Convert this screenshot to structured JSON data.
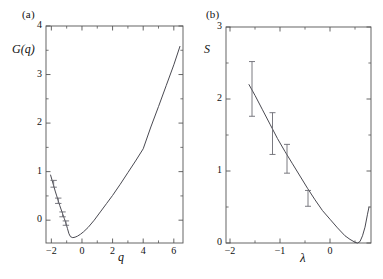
{
  "figure": {
    "panels": [
      {
        "id": "a",
        "label": "(a)",
        "ylabel": "G(q)",
        "xlabel": "q"
      },
      {
        "id": "b",
        "label": "(b)",
        "ylabel": "S",
        "xlabel": "λ"
      }
    ],
    "colors": {
      "axis": "#555555",
      "curve": "#4a4a52",
      "errorbar": "#6b6b73",
      "text": "#111111",
      "background": "#ffffff"
    }
  },
  "chart_data": [
    {
      "type": "line",
      "panel": "a",
      "title": "(a)",
      "xlabel": "q",
      "ylabel": "G(q)",
      "xlim": [
        -2.35,
        6.6
      ],
      "ylim": [
        -0.47,
        4.0
      ],
      "xticks": [
        -2,
        0,
        2,
        4,
        6
      ],
      "xtick_labels": [
        "−2",
        "0",
        "2",
        "4",
        "6"
      ],
      "xminor": [
        -1,
        1,
        3,
        5
      ],
      "yticks": [
        0,
        1,
        2,
        3,
        4
      ],
      "ytick_labels": [
        "0",
        "1",
        "2",
        "3",
        "4"
      ],
      "yminor": [
        -0.5,
        0.5,
        1.5,
        2.5,
        3.5
      ],
      "grid": false,
      "legend": "none",
      "series": [
        {
          "name": "G(q) curve",
          "x": [
            -2.05,
            -1.95,
            -1.85,
            -1.75,
            -1.65,
            -1.55,
            -1.45,
            -1.35,
            -1.25,
            -1.15,
            -1.05,
            -0.95,
            -0.85,
            -0.75,
            -0.6,
            -0.45,
            -0.3,
            -0.1,
            0.1,
            0.4,
            0.8,
            1.2,
            1.6,
            2.0,
            2.5,
            3.0,
            3.5,
            4.0,
            4.5,
            5.0,
            5.5,
            6.0,
            6.4
          ],
          "y": [
            0.93,
            0.82,
            0.71,
            0.6,
            0.5,
            0.4,
            0.3,
            0.21,
            0.12,
            0.03,
            -0.06,
            -0.17,
            -0.28,
            -0.34,
            -0.36,
            -0.35,
            -0.33,
            -0.29,
            -0.24,
            -0.15,
            0.0,
            0.17,
            0.34,
            0.51,
            0.74,
            0.98,
            1.22,
            1.47,
            1.92,
            2.34,
            2.77,
            3.2,
            3.58
          ]
        }
      ],
      "errorbars": [
        {
          "x": -1.85,
          "y": 0.75,
          "yerr": 0.07
        },
        {
          "x": -1.55,
          "y": 0.4,
          "yerr": 0.055
        },
        {
          "x": -1.27,
          "y": 0.12,
          "yerr": 0.05
        },
        {
          "x": -1.05,
          "y": -0.06,
          "yerr": 0.045
        }
      ]
    },
    {
      "type": "line",
      "panel": "b",
      "title": "(b)",
      "xlabel": "λ",
      "ylabel": "S",
      "xlim": [
        -2.08,
        0.82
      ],
      "ylim": [
        0.0,
        3.0
      ],
      "xticks": [
        -2,
        -1,
        0
      ],
      "xtick_labels": [
        "−2",
        "−1",
        "0"
      ],
      "xminor": [
        -1.5,
        -0.5,
        0.5
      ],
      "yticks": [
        0,
        1,
        2,
        3
      ],
      "ytick_labels": [
        "0",
        "1",
        "2",
        "3"
      ],
      "yminor": [
        0.5,
        1.5,
        2.5
      ],
      "grid": false,
      "legend": "none",
      "series": [
        {
          "name": "S curve",
          "x": [
            -1.62,
            -1.5,
            -1.35,
            -1.2,
            -1.05,
            -0.9,
            -0.75,
            -0.6,
            -0.45,
            -0.3,
            -0.15,
            0.0,
            0.15,
            0.3,
            0.4,
            0.5,
            0.55,
            0.6,
            0.65,
            0.7,
            0.75,
            0.78
          ],
          "y": [
            2.2,
            2.05,
            1.85,
            1.65,
            1.45,
            1.27,
            1.1,
            0.93,
            0.76,
            0.6,
            0.45,
            0.33,
            0.21,
            0.1,
            0.05,
            0.01,
            0.0,
            0.02,
            0.1,
            0.22,
            0.4,
            0.5
          ]
        }
      ],
      "errorbars": [
        {
          "x": -1.56,
          "y": 2.14,
          "yerr": 0.38
        },
        {
          "x": -1.15,
          "y": 1.52,
          "yerr": 0.29
        },
        {
          "x": -0.86,
          "y": 1.17,
          "yerr": 0.2
        },
        {
          "x": -0.44,
          "y": 0.62,
          "yerr": 0.11
        }
      ]
    }
  ]
}
